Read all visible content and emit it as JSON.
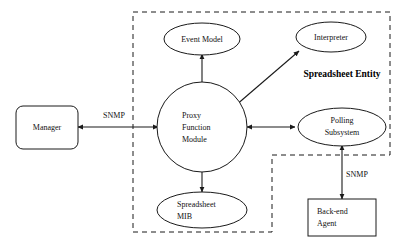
{
  "diagram": {
    "boundary_label": "Spreadsheet Entity",
    "colors": {
      "stroke": "#1a1a1a",
      "fill": "#ffffff",
      "text": "#111111",
      "background": "#ffffff"
    },
    "nodes": [
      {
        "id": "manager",
        "shape": "rounded-rectangle",
        "label_lines": [
          "Manager"
        ],
        "align": "center"
      },
      {
        "id": "event-model",
        "shape": "ellipse",
        "label_lines": [
          "Event Model"
        ],
        "align": "center"
      },
      {
        "id": "interpreter",
        "shape": "ellipse",
        "label_lines": [
          "Interpreter"
        ],
        "align": "center"
      },
      {
        "id": "proxy-function-module",
        "shape": "circle",
        "label_lines": [
          "Proxy",
          "Function",
          "Module"
        ],
        "align": "left"
      },
      {
        "id": "polling-subsystem",
        "shape": "ellipse",
        "label_lines": [
          "Polling",
          "Subsystem"
        ],
        "align": "center"
      },
      {
        "id": "spreadsheet-mib",
        "shape": "ellipse",
        "label_lines": [
          "Spreadsheet",
          "MIB"
        ],
        "align": "left"
      },
      {
        "id": "back-end-agent",
        "shape": "rectangle",
        "label_lines": [
          "Back-end",
          "Agent"
        ],
        "align": "left"
      }
    ],
    "edges": [
      {
        "id": "manager-proxy",
        "from": "manager",
        "to": "proxy-function-module",
        "label": "SNMP",
        "direction": "bidirectional"
      },
      {
        "id": "proxy-event-model",
        "from": "proxy-function-module",
        "to": "event-model",
        "label": "",
        "direction": "bidirectional"
      },
      {
        "id": "proxy-interpreter",
        "from": "proxy-function-module",
        "to": "interpreter",
        "label": "",
        "direction": "bidirectional"
      },
      {
        "id": "proxy-polling-subsystem",
        "from": "proxy-function-module",
        "to": "polling-subsystem",
        "label": "",
        "direction": "bidirectional"
      },
      {
        "id": "proxy-spreadsheet-mib",
        "from": "proxy-function-module",
        "to": "spreadsheet-mib",
        "label": "",
        "direction": "bidirectional"
      },
      {
        "id": "polling-subsystem-back-end-agent",
        "from": "polling-subsystem",
        "to": "back-end-agent",
        "label": "SNMP",
        "direction": "bidirectional"
      }
    ],
    "labels": {
      "manager": "Manager",
      "event_model": "Event Model",
      "interpreter": "Interpreter",
      "proxy_line1": "Proxy",
      "proxy_line2": "Function",
      "proxy_line3": "Module",
      "polling_line1": "Polling",
      "polling_line2": "Subsystem",
      "mib_line1": "Spreadsheet",
      "mib_line2": "MIB",
      "agent_line1": "Back-end",
      "agent_line2": "Agent",
      "snmp_left": "SNMP",
      "snmp_right": "SNMP",
      "entity": "Spreadsheet Entity"
    }
  }
}
